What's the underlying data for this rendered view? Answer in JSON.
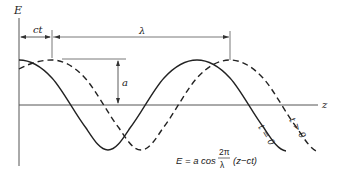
{
  "diagram": {
    "type": "traveling-wave",
    "axes": {
      "vertical_label": "E",
      "horizontal_label": "z"
    },
    "dimensions": {
      "shift_label": "ct",
      "wavelength_label": "λ",
      "amplitude_label": "a"
    },
    "curves": [
      {
        "name": "t=0",
        "style": "solid",
        "label": "t = 0"
      },
      {
        "name": "t>0",
        "style": "dashed",
        "label": "t > 0"
      }
    ],
    "formula": {
      "lhs": "E = a cos",
      "numerator": "2π",
      "denominator": "λ",
      "argument": "(z−ct)"
    },
    "colors": {
      "ink": "#222222",
      "axis": "#555555",
      "background": "#ffffff"
    }
  }
}
